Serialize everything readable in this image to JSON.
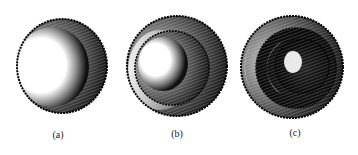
{
  "figure": {
    "panels": [
      {
        "id": "a",
        "label": "(a)",
        "rings": 1,
        "description": "single shaded tube opening with bright interior"
      },
      {
        "id": "b",
        "label": "(b)",
        "rings": 2,
        "description": "two nested shaded rings with bright interior"
      },
      {
        "id": "c",
        "label": "(c)",
        "rings": 3,
        "description": "three nested shaded rings with bright crescent highlights"
      }
    ],
    "colors": {
      "ink": "#111111",
      "highlight": "#ffffff",
      "background": "#ffffff"
    }
  }
}
